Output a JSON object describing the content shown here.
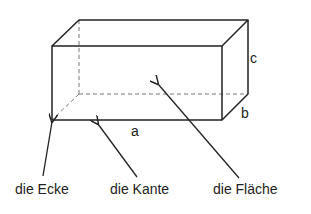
{
  "diagram": {
    "type": "cuboid-labeled",
    "colors": {
      "line": "#222222",
      "hidden_line": "#777777",
      "background": "#ffffff"
    },
    "dimensions": {
      "a": "a",
      "b": "b",
      "c": "c"
    },
    "terms": {
      "corner": "die Ecke",
      "edge": "die Kante",
      "face": "die Fläche"
    }
  }
}
